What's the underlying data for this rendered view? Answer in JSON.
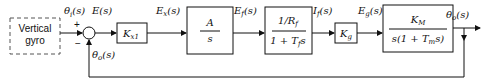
{
  "diagram": {
    "type": "block-diagram",
    "source_block": {
      "line1": "Vertical",
      "line2": "gyro"
    },
    "summing_junction": {
      "plus_sign": "+",
      "minus_sign": "−"
    },
    "signals": {
      "input": {
        "main": "θ",
        "sub": "i",
        "arg": "(s)"
      },
      "error": {
        "main": "E",
        "sub": "",
        "arg": "(s)"
      },
      "ex": {
        "main": "E",
        "sub": "x",
        "arg": "(s)"
      },
      "ef": {
        "main": "E",
        "sub": "f",
        "arg": "(s)"
      },
      "if": {
        "main": "I",
        "sub": "f",
        "arg": "(s)"
      },
      "eg": {
        "main": "E",
        "sub": "g",
        "arg": "(s)"
      },
      "output": {
        "main": "θ",
        "sub": "o",
        "arg": "(s)"
      },
      "feedback": {
        "main": "θ",
        "sub": "o",
        "arg": "(s)"
      }
    },
    "blocks": {
      "kx1": {
        "main": "K",
        "sub": "x1"
      },
      "integrator": {
        "num": "A",
        "den": "s"
      },
      "field": {
        "num_main": "1/R",
        "num_sub": "f",
        "den_pre": "1 + T",
        "den_sub": "f",
        "den_post": "s"
      },
      "kg": {
        "main": "K",
        "sub": "g"
      },
      "motor": {
        "num_main": "K",
        "num_sub": "M",
        "den_pre": "s(1 + T",
        "den_sub": "m",
        "den_post": "s)"
      }
    }
  }
}
